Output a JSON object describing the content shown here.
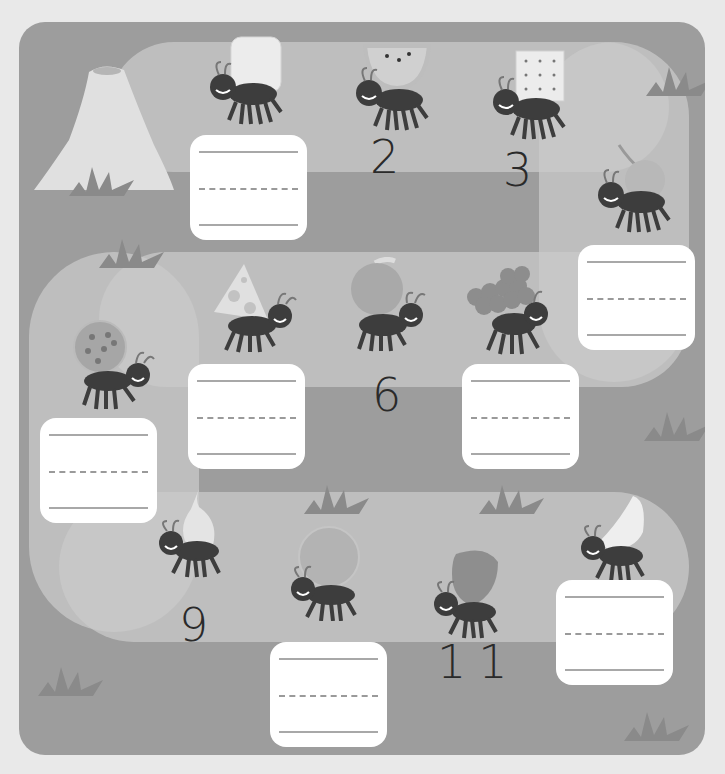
{
  "worksheet": {
    "title": "Ant number sequence path",
    "colors": {
      "page_background": "#e9e9e9",
      "board": "#9d9d9d",
      "path": "#c9c9c9",
      "writing_box": "#ffffff",
      "number_ink": "#2a2a2a"
    },
    "steps": [
      {
        "position": 1,
        "food": "bread",
        "shown_number": null,
        "has_writing_box": true
      },
      {
        "position": 2,
        "food": "watermelon",
        "shown_number": "2",
        "has_writing_box": false
      },
      {
        "position": 3,
        "food": "cracker",
        "shown_number": "3",
        "has_writing_box": false
      },
      {
        "position": 4,
        "food": "cherry",
        "shown_number": null,
        "has_writing_box": true
      },
      {
        "position": 5,
        "food": "grapes",
        "shown_number": null,
        "has_writing_box": true
      },
      {
        "position": 6,
        "food": "apple",
        "shown_number": "6",
        "has_writing_box": false
      },
      {
        "position": 7,
        "food": "cheese",
        "shown_number": null,
        "has_writing_box": true
      },
      {
        "position": 8,
        "food": "cookie",
        "shown_number": null,
        "has_writing_box": true
      },
      {
        "position": 9,
        "food": "pear",
        "shown_number": "9",
        "has_writing_box": false
      },
      {
        "position": 10,
        "food": "orange",
        "shown_number": null,
        "has_writing_box": true
      },
      {
        "position": 11,
        "food": "strawberry",
        "shown_number": "11",
        "has_writing_box": false
      },
      {
        "position": 12,
        "food": "banana",
        "shown_number": null,
        "has_writing_box": true
      }
    ],
    "numbers": {
      "n2": "2",
      "n3": "3",
      "n6": "6",
      "n9": "9",
      "n11": "11"
    }
  }
}
